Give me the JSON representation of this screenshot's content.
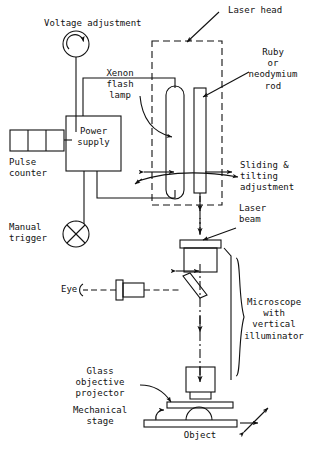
{
  "figure": {
    "type": "schematic-diagram",
    "width": 311,
    "height": 451,
    "stroke_color": "#111111",
    "background_color": "#ffffff"
  },
  "labels": {
    "voltage_adjustment": "Voltage adjustment",
    "laser_head": "Laser head",
    "ruby_rod": "Ruby\nor\nneodymium\nrod",
    "xenon_lamp": "Xenon\nflash\nlamp",
    "power_supply": "Power\nsupply",
    "pulse_counter": "Pulse\ncounter",
    "sliding_tilting": "Sliding &\ntilting\nadjustment",
    "manual_trigger": "Manual\ntrigger",
    "laser_beam": "Laser\nbeam",
    "eye": "Eye",
    "microscope": "Microscope\nwith\nvertical\nilluminator",
    "glass_objective_projector": "Glass\nobjective\nprojector",
    "mechanical_stage": "Mechanical\nstage",
    "object": "Object"
  },
  "components": [
    {
      "name": "voltage-adjustment-dial",
      "shape": "circle-with-rotation-arrow"
    },
    {
      "name": "pulse-counter-box",
      "shape": "three-cell-rectangle"
    },
    {
      "name": "power-supply-box",
      "shape": "rectangle"
    },
    {
      "name": "manual-trigger-switch",
      "shape": "circle-with-x"
    },
    {
      "name": "laser-head-enclosure",
      "shape": "dashed-rectangle"
    },
    {
      "name": "xenon-flash-lamp-tube",
      "shape": "rounded-tube"
    },
    {
      "name": "laser-rod",
      "shape": "narrow-rectangle"
    },
    {
      "name": "vertical-illuminator-housing",
      "shape": "rectangle-with-cap"
    },
    {
      "name": "eyepiece",
      "shape": "stepped-rectangle"
    },
    {
      "name": "beam-splitter-mirror",
      "shape": "tilted-parallelogram"
    },
    {
      "name": "objective-lens",
      "shape": "stepped-barrel"
    },
    {
      "name": "glass-projector-plate",
      "shape": "thin-rectangle"
    },
    {
      "name": "mechanical-stage-bar",
      "shape": "thin-rectangle"
    },
    {
      "name": "object-specimen",
      "shape": "half-dome"
    },
    {
      "name": "laser-beam-path",
      "shape": "dash-dot-arrow-line"
    },
    {
      "name": "microscope-brace",
      "shape": "curly-brace"
    }
  ]
}
